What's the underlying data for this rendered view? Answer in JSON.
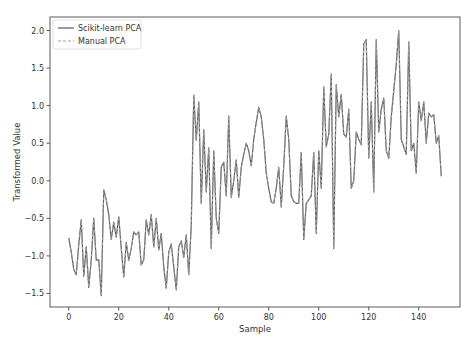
{
  "chart_data": {
    "type": "line",
    "title": "",
    "xlabel": "Sample",
    "ylabel": "Transformed Value",
    "xlim": [
      -7.5,
      156.5
    ],
    "ylim": [
      -1.68,
      2.18
    ],
    "xticks": [
      0,
      20,
      40,
      60,
      80,
      100,
      120,
      140
    ],
    "yticks": [
      -1.5,
      -1.0,
      -0.5,
      0.0,
      0.5,
      1.0,
      1.5,
      2.0
    ],
    "ytick_labels": [
      "−1.5",
      "−1.0",
      "−0.5",
      "0.0",
      "0.5",
      "1.0",
      "1.5",
      "2.0"
    ],
    "grid": false,
    "legend_position": "upper left",
    "series": [
      {
        "name": "Scikit-learn PCA",
        "style": "solid",
        "color": "#5a5a5a",
        "values": [
          -0.76,
          -0.95,
          -1.18,
          -1.25,
          -0.85,
          -0.52,
          -1.27,
          -0.88,
          -1.42,
          -1.05,
          -0.5,
          -1.06,
          -1.05,
          -1.53,
          -0.12,
          -0.25,
          -0.45,
          -0.78,
          -0.55,
          -0.75,
          -0.48,
          -0.9,
          -1.28,
          -0.82,
          -1.06,
          -0.9,
          -0.68,
          -0.72,
          -0.68,
          -1.12,
          -1.05,
          -0.52,
          -0.72,
          -0.45,
          -0.88,
          -0.5,
          -0.92,
          -0.7,
          -1.15,
          -1.43,
          -0.95,
          -0.84,
          -1.15,
          -1.45,
          -0.88,
          -0.8,
          -1.02,
          -0.72,
          -1.25,
          -0.6,
          1.14,
          0.54,
          1.05,
          -0.3,
          0.68,
          -0.15,
          0.44,
          -0.9,
          0.4,
          -0.5,
          -0.7,
          0.18,
          0.25,
          -0.2,
          0.86,
          -0.22,
          0.0,
          0.28,
          -0.22,
          0.18,
          0.35,
          0.5,
          0.4,
          0.2,
          0.55,
          0.78,
          0.98,
          0.85,
          0.55,
          0.1,
          -0.1,
          -0.28,
          -0.3,
          -0.1,
          0.18,
          -0.35,
          0.2,
          0.86,
          0.55,
          -0.2,
          -0.28,
          -0.3,
          -0.3,
          0.38,
          -0.78,
          -0.3,
          -0.25,
          -0.2,
          0.38,
          -0.7,
          0.4,
          -0.1,
          1.25,
          0.45,
          0.62,
          1.42,
          -0.9,
          1.28,
          0.85,
          1.15,
          0.62,
          0.58,
          0.95,
          -0.1,
          0.0,
          0.65,
          0.55,
          0.48,
          1.82,
          1.88,
          0.3,
          1.05,
          -0.15,
          1.88,
          0.65,
          0.95,
          1.1,
          0.4,
          0.3,
          0.85,
          1.2,
          1.55,
          2.0,
          0.55,
          0.45,
          0.35,
          1.85,
          0.4,
          0.5,
          0.1,
          1.05,
          0.8,
          1.05,
          0.5,
          0.9,
          0.85,
          0.88,
          0.5,
          0.6,
          0.06
        ]
      },
      {
        "name": "Manual PCA",
        "style": "dashed",
        "color": "#a0a0a0",
        "values": [
          -0.76,
          -0.95,
          -1.18,
          -1.25,
          -0.85,
          -0.52,
          -1.27,
          -0.88,
          -1.42,
          -1.05,
          -0.5,
          -1.06,
          -1.05,
          -1.53,
          -0.12,
          -0.25,
          -0.45,
          -0.78,
          -0.55,
          -0.75,
          -0.48,
          -0.9,
          -1.28,
          -0.82,
          -1.06,
          -0.9,
          -0.68,
          -0.72,
          -0.68,
          -1.12,
          -1.05,
          -0.52,
          -0.72,
          -0.45,
          -0.88,
          -0.5,
          -0.92,
          -0.7,
          -1.15,
          -1.43,
          -0.95,
          -0.84,
          -1.15,
          -1.45,
          -0.88,
          -0.8,
          -1.02,
          -0.72,
          -1.25,
          -0.6,
          1.14,
          0.54,
          1.05,
          -0.3,
          0.68,
          -0.15,
          0.44,
          -0.9,
          0.4,
          -0.5,
          -0.7,
          0.18,
          0.25,
          -0.2,
          0.86,
          -0.22,
          0.0,
          0.28,
          -0.22,
          0.18,
          0.35,
          0.5,
          0.4,
          0.2,
          0.55,
          0.78,
          0.98,
          0.85,
          0.55,
          0.1,
          -0.1,
          -0.28,
          -0.3,
          -0.1,
          0.18,
          -0.35,
          0.2,
          0.86,
          0.55,
          -0.2,
          -0.28,
          -0.3,
          -0.3,
          0.38,
          -0.78,
          -0.3,
          -0.25,
          -0.2,
          0.38,
          -0.7,
          0.4,
          -0.1,
          1.25,
          0.45,
          0.62,
          1.42,
          -0.9,
          1.28,
          0.85,
          1.15,
          0.62,
          0.58,
          0.95,
          -0.1,
          0.0,
          0.65,
          0.55,
          0.48,
          1.82,
          1.88,
          0.3,
          1.05,
          -0.15,
          1.88,
          0.65,
          0.95,
          1.1,
          0.4,
          0.3,
          0.85,
          1.2,
          1.55,
          2.0,
          0.55,
          0.45,
          0.35,
          1.85,
          0.4,
          0.5,
          0.1,
          1.05,
          0.8,
          1.05,
          0.5,
          0.9,
          0.85,
          0.88,
          0.5,
          0.6,
          0.06
        ]
      }
    ]
  },
  "legend": {
    "items": [
      {
        "label": "Scikit-learn PCA",
        "style": "solid"
      },
      {
        "label": "Manual PCA",
        "style": "dashed"
      }
    ]
  },
  "axes": {
    "xlabel": "Sample",
    "ylabel": "Transformed Value"
  }
}
